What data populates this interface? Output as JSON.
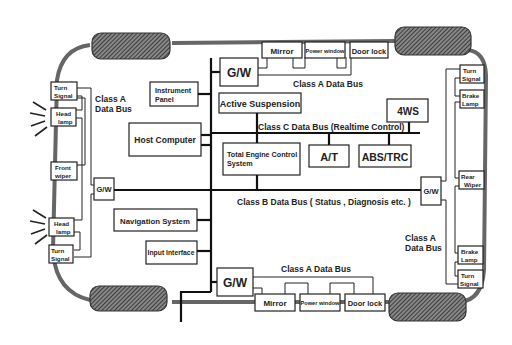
{
  "diagram": {
    "buses": {
      "class_a_top": "Class A Data Bus",
      "class_a_bottom": "Class A Data Bus",
      "class_a_left_1": "Class A",
      "class_a_left_2": "Data Bus",
      "class_a_right_1": "Class A",
      "class_a_right_2": "Data Bus",
      "class_b": "Class B Data Bus ( Status , Diagnosis etc. )",
      "class_c": "Class C Data Bus (Realtime Control)"
    },
    "nodes": {
      "gw_top": "G/W",
      "gw_bottom": "G/W",
      "gw_left": "G/W",
      "gw_right": "G/W",
      "mirror_top": "Mirror",
      "power_window_top": "Power window",
      "door_lock_top": "Door lock",
      "mirror_bottom": "Mirror",
      "power_window_bottom": "Power window",
      "door_lock_bottom": "Door lock",
      "instrument_panel_1": "Instrument",
      "instrument_panel_2": "Panel",
      "active_suspension": "Active Suspension",
      "host_computer": "Host Computer",
      "total_engine_1": "Total Engine Control",
      "total_engine_2": "System",
      "at": "A/T",
      "abs_trc": "ABS/TRC",
      "four_ws": "4WS",
      "navigation": "Navigation System",
      "input_interface": "Input Interface",
      "left": {
        "turn_signal_top_1": "Turn",
        "turn_signal_top_2": "Signal",
        "head_lamp_top_1": "Head",
        "head_lamp_top_2": "lamp",
        "front_wiper_1": "Front",
        "front_wiper_2": "wiper",
        "head_lamp_bottom_1": "Head",
        "head_lamp_bottom_2": "lamp",
        "turn_signal_bottom_1": "Turn",
        "turn_signal_bottom_2": "Signal"
      },
      "right": {
        "turn_signal_top_1": "Turn",
        "turn_signal_top_2": "Signal",
        "brake_lamp_top_1": "Brake",
        "brake_lamp_top_2": "Lamp",
        "rear_wiper_1": "Rear",
        "rear_wiper_2": "Wiper",
        "brake_lamp_bottom_1": "Brake",
        "brake_lamp_bottom_2": "Lamp",
        "turn_signal_bottom_1": "Turn",
        "turn_signal_bottom_2": "Signal"
      }
    }
  }
}
